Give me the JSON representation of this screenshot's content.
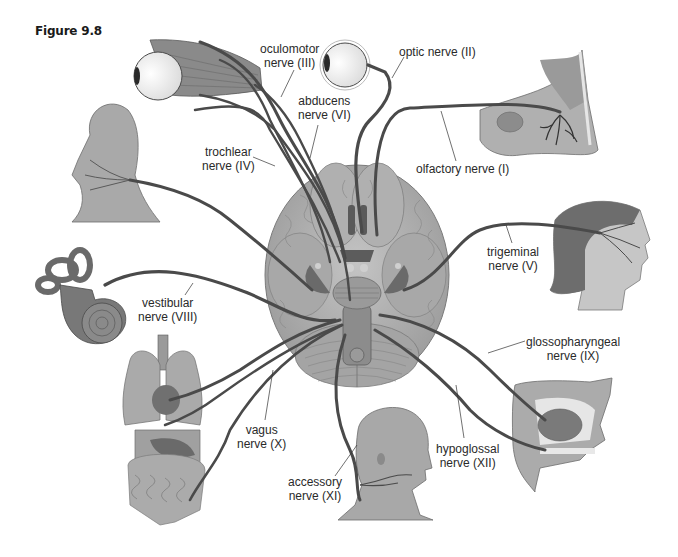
{
  "figure": {
    "title": "Figure 9.8",
    "colors": {
      "nerve": "#4a4a4a",
      "tissue_light": "#b8b8b8",
      "tissue_mid": "#8e8e8e",
      "tissue_dark": "#5a5a5a",
      "background": "#ffffff",
      "text": "#2a2a2a"
    }
  },
  "labels": [
    {
      "id": "oculomotor",
      "line1": "oculomotor",
      "line2": "nerve (III)"
    },
    {
      "id": "optic",
      "line1": "optic nerve (II)",
      "line2": ""
    },
    {
      "id": "abducens",
      "line1": "abducens",
      "line2": "nerve (VI)"
    },
    {
      "id": "trochlear",
      "line1": "trochlear",
      "line2": "nerve (IV)"
    },
    {
      "id": "olfactory",
      "line1": "olfactory nerve (I)",
      "line2": ""
    },
    {
      "id": "trigeminal",
      "line1": "trigeminal",
      "line2": "nerve (V)"
    },
    {
      "id": "vestibular",
      "line1": "vestibular",
      "line2": "nerve (VIII)"
    },
    {
      "id": "glossopharyngeal",
      "line1": "glossopharyngeal",
      "line2": "nerve (IX)"
    },
    {
      "id": "vagus",
      "line1": "vagus",
      "line2": "nerve (X)"
    },
    {
      "id": "hypoglossal",
      "line1": "hypoglossal",
      "line2": "nerve (XII)"
    },
    {
      "id": "accessory",
      "line1": "accessory",
      "line2": "nerve (XI)"
    }
  ],
  "illustrations": [
    "brain-inferior-view",
    "eye-with-muscles",
    "eye-optic",
    "nasal-cavity",
    "face-muscles-head",
    "female-head-profile",
    "inner-ear",
    "thoracic-abdominal-organs",
    "head-neck-accessory",
    "oral-cavity-tongue"
  ]
}
